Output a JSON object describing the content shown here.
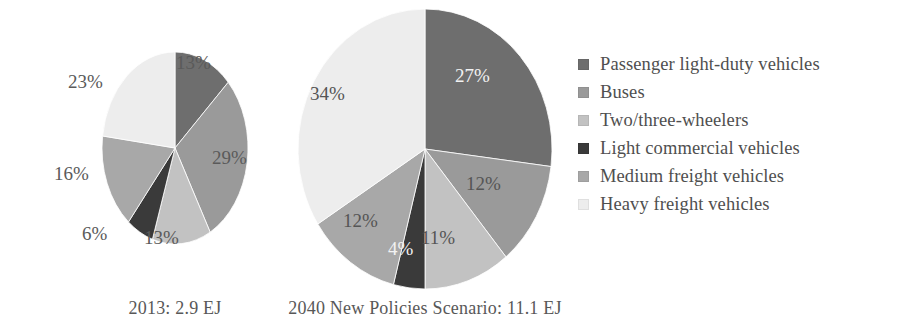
{
  "chart_data": [
    {
      "type": "pie",
      "title": "2013: 2.9 EJ",
      "id": "2013",
      "total_label": "2.9 EJ",
      "year": "2013",
      "categories": [
        "Passenger light-duty vehicles",
        "Buses",
        "Two/three-wheelers",
        "Light commercial vehicles",
        "Medium freight vehicles",
        "Heavy freight vehicles"
      ],
      "values": [
        13,
        29,
        13,
        6,
        16,
        23
      ],
      "value_labels": [
        "13%",
        "29%",
        "13%",
        "6%",
        "16%",
        "23%"
      ],
      "colors": [
        "#6e6e6e",
        "#9a9a9a",
        "#c2c2c2",
        "#3a3a3a",
        "#a8a8a8",
        "#ededed"
      ],
      "start_angle_deg": 0,
      "direction": "clockwise",
      "legend": "shared"
    },
    {
      "type": "pie",
      "title": "2040 New Policies Scenario: 11.1 EJ",
      "id": "2040",
      "total_label": "11.1 EJ",
      "year": "2040",
      "categories": [
        "Passenger light-duty vehicles",
        "Buses",
        "Two/three-wheelers",
        "Light commercial vehicles",
        "Medium freight vehicles",
        "Heavy freight vehicles"
      ],
      "values": [
        27,
        12,
        11,
        4,
        12,
        34
      ],
      "value_labels": [
        "27%",
        "12%",
        "11%",
        "4%",
        "12%",
        "34%"
      ],
      "colors": [
        "#6e6e6e",
        "#9a9a9a",
        "#c2c2c2",
        "#3a3a3a",
        "#a8a8a8",
        "#ededed"
      ],
      "start_angle_deg": 0,
      "direction": "clockwise",
      "legend": "shared"
    }
  ],
  "pie_2013": {
    "caption": "2013: 2.9 EJ",
    "labels": {
      "passenger": "13%",
      "buses": "29%",
      "two_three_wheelers": "13%",
      "light_commercial": "6%",
      "medium_freight": "16%",
      "heavy_freight": "23%"
    }
  },
  "pie_2040": {
    "caption": "2040 New Policies Scenario: 11.1 EJ",
    "labels": {
      "passenger": "27%",
      "buses": "12%",
      "two_three_wheelers": "11%",
      "light_commercial": "4%",
      "medium_freight": "12%",
      "heavy_freight": "34%"
    }
  },
  "legend": {
    "items": [
      {
        "label": "Passenger light-duty vehicles",
        "color": "#6e6e6e"
      },
      {
        "label": "Buses",
        "color": "#9a9a9a"
      },
      {
        "label": "Two/three-wheelers",
        "color": "#c2c2c2"
      },
      {
        "label": "Light commercial vehicles",
        "color": "#3a3a3a"
      },
      {
        "label": "Medium freight vehicles",
        "color": "#a8a8a8"
      },
      {
        "label": "Heavy freight vehicles",
        "color": "#ededed"
      }
    ]
  }
}
